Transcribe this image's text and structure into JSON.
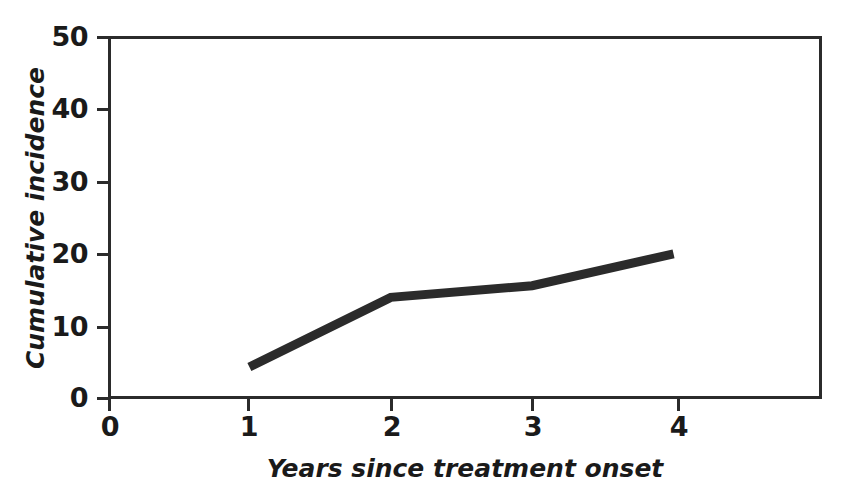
{
  "chart_data": {
    "type": "line",
    "title": "",
    "xlabel": "Years since treatment onset",
    "ylabel": "Cumulative incidence",
    "xlim": [
      0,
      5.05
    ],
    "ylim": [
      0,
      50
    ],
    "xticks": [
      0,
      1,
      2,
      3,
      4
    ],
    "xtick_labels": [
      "0",
      "1",
      "2",
      "3",
      "4"
    ],
    "yticks": [
      0,
      10,
      20,
      30,
      40,
      50
    ],
    "ytick_labels": [
      "0",
      "10",
      "20",
      "30",
      "40",
      "50"
    ],
    "grid": false,
    "legend": null,
    "series": [
      {
        "name": "Cumulative incidence",
        "color": "#2b2b2b",
        "line_width_px": 9,
        "x": [
          1,
          2,
          3,
          4
        ],
        "values": [
          4.4,
          14.0,
          15.6,
          20.0
        ]
      }
    ]
  },
  "axis": {
    "frame_color": "#2b2b2b",
    "tick_color": "#2b2b2b",
    "text_color": "#1a1a1a"
  }
}
